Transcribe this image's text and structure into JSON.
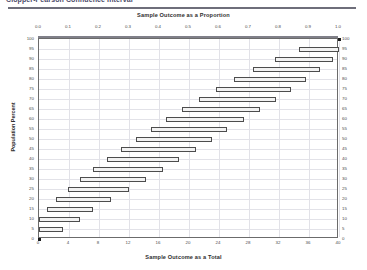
{
  "page": {
    "header_text": "Clopper-Pearson Confidence Interval",
    "top_axis_title": "Sample Outcome as a Proportion",
    "bottom_axis_title": "Sample Outcome as a Total",
    "y_axis_title": "Population Percent"
  },
  "chart_data": {
    "type": "bar",
    "title": "Sample Outcome as a Proportion",
    "subtitle": "Sample Outcome as a Total",
    "xlabel": "Sample Outcome as a Total",
    "ylabel": "Population Percent",
    "orientation": "horizontal",
    "grid": true,
    "legend": "none",
    "x_top_label": "Sample Outcome as a Proportion",
    "x_top_ticks": [
      "0.0",
      "0.1",
      "0.2",
      "0.3",
      "0.4",
      "0.5",
      "0.6",
      "0.7",
      "0.8",
      "0.9",
      "1.0"
    ],
    "x_top_values": [
      0.0,
      0.1,
      0.2,
      0.3,
      0.4,
      0.5,
      0.6,
      0.7,
      0.8,
      0.9,
      1.0
    ],
    "x_bottom_label": "Sample Outcome as a Total",
    "x_bottom_ticks": [
      "0",
      "4",
      "8",
      "12",
      "16",
      "20",
      "24",
      "28",
      "32",
      "36",
      "40"
    ],
    "x_bottom_values": [
      0,
      4,
      8,
      12,
      16,
      20,
      24,
      28,
      32,
      36,
      40
    ],
    "xlim": [
      0,
      40
    ],
    "ylim": [
      0,
      100
    ],
    "y_ticks": [
      "0",
      "5",
      "10",
      "15",
      "20",
      "25",
      "30",
      "35",
      "40",
      "45",
      "50",
      "55",
      "60",
      "65",
      "70",
      "75",
      "80",
      "85",
      "90",
      "95",
      "100"
    ],
    "y_values": [
      0,
      5,
      10,
      15,
      20,
      25,
      30,
      35,
      40,
      45,
      50,
      55,
      60,
      65,
      70,
      75,
      80,
      85,
      90,
      95,
      100
    ],
    "bar_color": "#f2f2f2",
    "bar_edge_color": "#4d4d4d",
    "grid_color": "#e2e2e8",
    "axis_color": "#6b6b6b",
    "categories": [
      100,
      95,
      90,
      85,
      80,
      75,
      70,
      65,
      60,
      55,
      50,
      45,
      40,
      35,
      30,
      25,
      20,
      15,
      10,
      5,
      0
    ],
    "series": [
      {
        "name": "Confidence interval (total count)",
        "intervals": [
          {
            "percent": 100,
            "low": 40.0,
            "high": 40.0
          },
          {
            "percent": 95,
            "low": 34.6,
            "high": 40.0
          },
          {
            "percent": 90,
            "low": 31.4,
            "high": 39.2
          },
          {
            "percent": 85,
            "low": 28.5,
            "high": 37.5
          },
          {
            "percent": 80,
            "low": 26.0,
            "high": 35.6
          },
          {
            "percent": 75,
            "low": 23.6,
            "high": 33.6
          },
          {
            "percent": 70,
            "low": 21.3,
            "high": 31.6
          },
          {
            "percent": 65,
            "low": 19.1,
            "high": 29.4
          },
          {
            "percent": 60,
            "low": 16.9,
            "high": 27.3
          },
          {
            "percent": 55,
            "low": 14.9,
            "high": 25.1
          },
          {
            "percent": 50,
            "low": 12.9,
            "high": 23.0
          },
          {
            "percent": 45,
            "low": 10.9,
            "high": 20.9
          },
          {
            "percent": 40,
            "low": 9.0,
            "high": 18.7
          },
          {
            "percent": 35,
            "low": 7.2,
            "high": 16.5
          },
          {
            "percent": 30,
            "low": 5.4,
            "high": 14.3
          },
          {
            "percent": 25,
            "low": 3.8,
            "high": 12.0
          },
          {
            "percent": 20,
            "low": 2.3,
            "high": 9.6
          },
          {
            "percent": 15,
            "low": 1.0,
            "high": 7.2
          },
          {
            "percent": 10,
            "low": 0.0,
            "high": 5.5
          },
          {
            "percent": 5,
            "low": 0.0,
            "high": 3.2
          },
          {
            "percent": 0,
            "low": 0.0,
            "high": 0.0
          }
        ]
      }
    ]
  }
}
